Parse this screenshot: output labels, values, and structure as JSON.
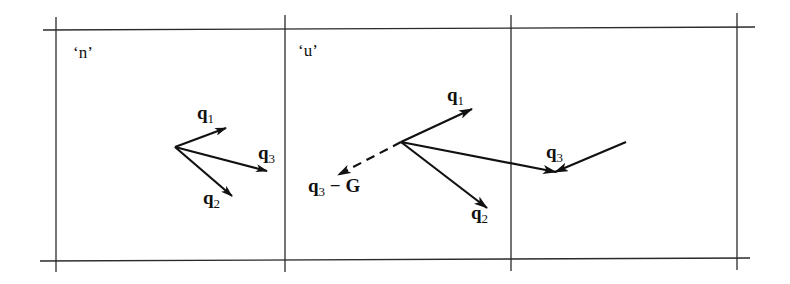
{
  "diagram": {
    "type": "wavevector-scattering",
    "colors": {
      "line": "#222222",
      "arrow": "#111111",
      "background": "#ffffff"
    },
    "cells": [
      {
        "id": "left",
        "label": "‘n’"
      },
      {
        "id": "middle",
        "label": "‘u’"
      },
      {
        "id": "right",
        "label": ""
      }
    ],
    "left_cell": {
      "vectors": [
        {
          "name": "q",
          "sub": "1"
        },
        {
          "name": "q",
          "sub": "2"
        },
        {
          "name": "q",
          "sub": "3"
        }
      ]
    },
    "middle_cell": {
      "vectors": [
        {
          "name": "q",
          "sub": "1"
        },
        {
          "name": "q",
          "sub": "2"
        },
        {
          "name": "q",
          "sub": "3"
        }
      ],
      "dashed_vector": {
        "name": "q",
        "sub": "3",
        "suffix": " − G"
      }
    }
  }
}
